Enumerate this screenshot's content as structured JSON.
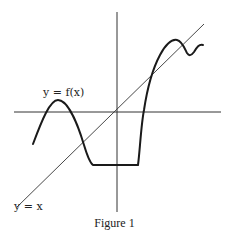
{
  "figure": {
    "caption": "Figure 1",
    "curve_label": "y = f(x)",
    "line_label": "y = x",
    "colors": {
      "ink": "#222222",
      "background": "#ffffff"
    }
  }
}
